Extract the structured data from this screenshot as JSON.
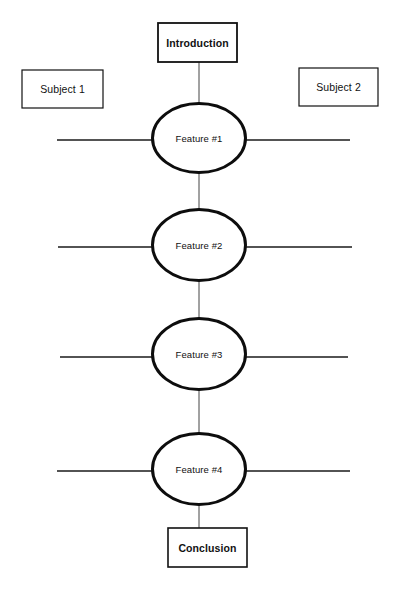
{
  "diagram": {
    "title_box": {
      "label": "Introduction",
      "x": 158,
      "y": 23,
      "w": 79,
      "h": 39,
      "stroke": "#111111",
      "stroke_width": 1.8
    },
    "conclusion_box": {
      "label": "Conclusion",
      "x": 168,
      "y": 528,
      "w": 79,
      "h": 39,
      "stroke": "#111111",
      "stroke_width": 1.6
    },
    "subjects": [
      {
        "label": "Subject 1",
        "x": 22,
        "y": 70,
        "w": 81,
        "h": 38,
        "stroke": "#111111",
        "stroke_width": 1.2
      },
      {
        "label": "Subject 2",
        "x": 299,
        "y": 68,
        "w": 79,
        "h": 38,
        "stroke": "#111111",
        "stroke_width": 1.2
      }
    ],
    "features": [
      {
        "label": "Feature #1",
        "cx": 199,
        "cy": 138,
        "rx": 47,
        "ry": 35,
        "line_left_x": 57,
        "line_right_x": 350
      },
      {
        "label": "Feature #2",
        "cx": 199,
        "cy": 245,
        "rx": 47,
        "ry": 36,
        "line_left_x": 58,
        "line_right_x": 352
      },
      {
        "label": "Feature #3",
        "cx": 199,
        "cy": 354,
        "rx": 47,
        "ry": 36,
        "line_left_x": 60,
        "line_right_x": 348
      },
      {
        "label": "Feature #4",
        "cx": 199,
        "cy": 469,
        "rx": 47,
        "ry": 36,
        "line_left_x": 57,
        "line_right_x": 350
      }
    ],
    "colors": {
      "ink": "#111111",
      "background": "#ffffff",
      "thin_line": "#333333"
    },
    "strokes": {
      "ellipse_width": 3.0,
      "horizontal_width": 1.4,
      "connector_width": 1.0
    },
    "connectors": [
      {
        "from": "introduction",
        "to": "feature-1",
        "x": 199,
        "y1": 62,
        "y2": 103
      },
      {
        "from": "feature-1",
        "to": "feature-2",
        "x": 199,
        "y1": 173,
        "y2": 209
      },
      {
        "from": "feature-2",
        "to": "feature-3",
        "x": 199,
        "y1": 281,
        "y2": 318
      },
      {
        "from": "feature-3",
        "to": "feature-4",
        "x": 199,
        "y1": 390,
        "y2": 433
      },
      {
        "from": "feature-4",
        "to": "conclusion",
        "x": 199,
        "y1": 505,
        "y2": 528
      }
    ]
  }
}
